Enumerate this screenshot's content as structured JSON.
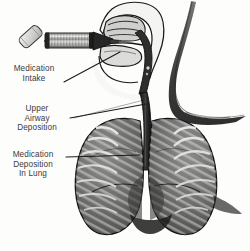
{
  "figure": {
    "background_color": "#fdfdfc",
    "text_color": "#3b3b3b",
    "line_color": "#1a1a1a",
    "lung_fill": "#6f6f6f",
    "rib_fill": "#e8e8e6",
    "trachea_fill": "#2b2b2b",
    "canister_fill": "#d9d9d7",
    "chamber_fill": "#9a9a98",
    "mouthpiece_fill": "#262626"
  },
  "labels": [
    {
      "id": "medication-intake",
      "lines": [
        "Medication",
        "Intake"
      ],
      "line1": "Medication",
      "line2": "Intake"
    },
    {
      "id": "upper-airway-deposition",
      "lines": [
        "Upper",
        "Airway",
        "Deposition"
      ],
      "line1": "Upper",
      "line2": "Airway",
      "line3": "Deposition"
    },
    {
      "id": "medication-deposition-in-lung",
      "lines": [
        "Medication",
        "Deposition",
        "In Lung"
      ],
      "line1": "Medication",
      "line2": "Deposition",
      "line3": "In Lung"
    }
  ],
  "parts": {
    "inhaler_canister": "inhaler-canister",
    "spacer_chamber": "spacer-chamber",
    "mouthpiece": "mouthpiece",
    "head_sagittal": "head-sagittal-section",
    "nasal_cavity": "nasal-cavity",
    "tongue": "tongue",
    "pharynx": "pharynx",
    "trachea": "trachea",
    "left_lung": "left-lung",
    "right_lung": "right-lung",
    "ribs": "rib-cage",
    "neck_shoulder": "neck-shoulder-contour"
  }
}
